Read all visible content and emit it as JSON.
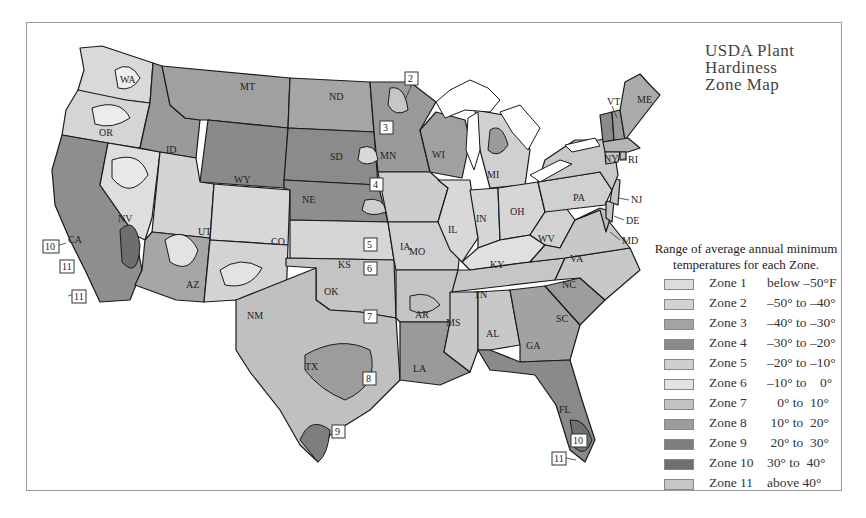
{
  "title": {
    "line1": "USDA Plant",
    "line2": "Hardiness",
    "line3": "Zone Map"
  },
  "legend": {
    "caption_line1": "Range of average annual minimum",
    "caption_line2": "temperatures for each Zone.",
    "items": [
      {
        "zone": "Zone 1",
        "range": "below –50°F",
        "color": "#dcdcdc"
      },
      {
        "zone": "Zone 2",
        "range": "–50° to –40°",
        "color": "#d2d2d2"
      },
      {
        "zone": "Zone 3",
        "range": "–40° to –30°",
        "color": "#a3a3a3"
      },
      {
        "zone": "Zone 4",
        "range": "–30° to –20°",
        "color": "#8a8a8a"
      },
      {
        "zone": "Zone 5",
        "range": "–20° to –10°",
        "color": "#cfcfcf"
      },
      {
        "zone": "Zone 6",
        "range": "–10° to    0°",
        "color": "#e2e2e2"
      },
      {
        "zone": "Zone 7",
        "range": "   0° to  10°",
        "color": "#c2c2c2"
      },
      {
        "zone": "Zone 8",
        "range": " 10° to  20°",
        "color": "#9c9c9c"
      },
      {
        "zone": "Zone 9",
        "range": " 20° to  30°",
        "color": "#7e7e7e"
      },
      {
        "zone": "Zone 10",
        "range": "30° to  40°",
        "color": "#707070"
      },
      {
        "zone": "Zone 11",
        "range": "above 40°",
        "color": "#c6c6c6"
      }
    ]
  },
  "states": [
    "WA",
    "OR",
    "CA",
    "NV",
    "ID",
    "MT",
    "WY",
    "UT",
    "AZ",
    "CO",
    "NM",
    "ND",
    "SD",
    "NE",
    "KS",
    "OK",
    "TX",
    "MN",
    "IA",
    "MO",
    "AR",
    "LA",
    "WI",
    "IL",
    "MS",
    "MI",
    "IN",
    "KY",
    "TN",
    "AL",
    "OH",
    "WV",
    "GA",
    "FL",
    "SC",
    "NC",
    "VA",
    "PA",
    "NY",
    "VT",
    "ME",
    "NH",
    "MA",
    "CT",
    "RI",
    "NJ",
    "DE",
    "MD"
  ],
  "zone_callouts": [
    "2",
    "3",
    "4",
    "5",
    "6",
    "7",
    "8",
    "9",
    "10",
    "11",
    "11",
    "10",
    "11"
  ]
}
